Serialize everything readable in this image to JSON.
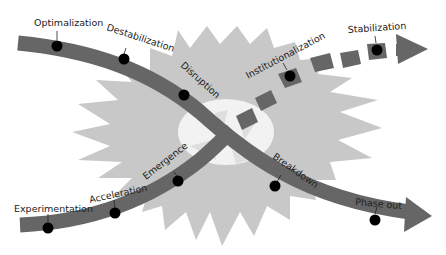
{
  "diagram": {
    "type": "transition-x-curve",
    "colors": {
      "background": "#ffffff",
      "starburst": "#c8c8c8",
      "center_ellipse": "#f2f2f2",
      "arrow": "#666666",
      "marker": "#000000",
      "label": "#222222"
    },
    "declining_path": {
      "direction": "top-left to bottom-right",
      "stages": [
        {
          "label": "Optimalization"
        },
        {
          "label": "Destabilization"
        },
        {
          "label": "Disruption"
        },
        {
          "label": "Breakdown"
        },
        {
          "label": "Phase out"
        }
      ]
    },
    "emerging_path": {
      "direction": "bottom-left to top-right",
      "stages": [
        {
          "label": "Experimentation"
        },
        {
          "label": "Acceleration"
        },
        {
          "label": "Emergence"
        },
        {
          "label": "Institutionalization"
        },
        {
          "label": "Stabilization"
        }
      ],
      "dashed_after": "Emergence"
    }
  }
}
